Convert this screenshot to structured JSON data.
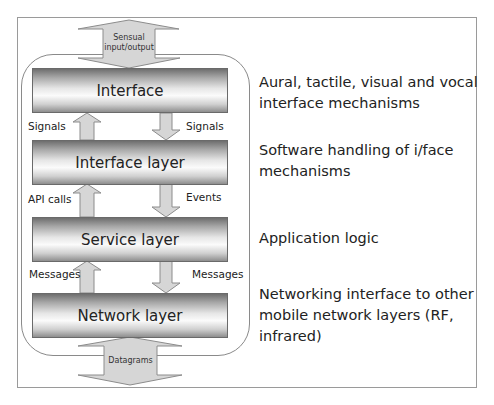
{
  "diagram": {
    "top_arrow_label_line1": "Sensual",
    "top_arrow_label_line2": "input/output",
    "bottom_arrow_label": "Datagrams",
    "layers": [
      {
        "name": "Interface",
        "description": "Aural, tactile, visual and vocal interface mechanisms"
      },
      {
        "name": "Interface layer",
        "description": "Software handling of i/face mechanisms"
      },
      {
        "name": "Service layer",
        "description": "Application logic"
      },
      {
        "name": "Network layer",
        "description": "Networking interface to other mobile network layers (RF, infrared)"
      }
    ],
    "connections": [
      {
        "up_label": "Signals",
        "down_label": "Signals"
      },
      {
        "up_label": "API calls",
        "down_label": "Events"
      },
      {
        "up_label": "Messages",
        "down_label": "Messages"
      }
    ],
    "colors": {
      "arrow_fill": "#d6d6d6",
      "arrow_stroke": "#8c8c8c",
      "frame": "#9a9a9a",
      "text": "#222222"
    }
  }
}
